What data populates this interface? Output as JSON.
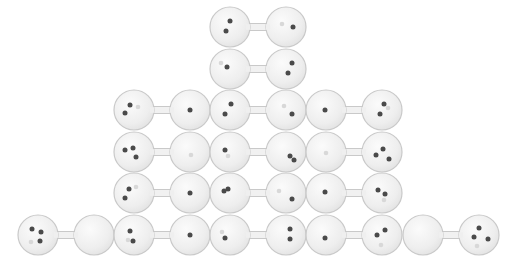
{
  "diagram": {
    "colors": {
      "background": "#ffffff",
      "bulb_fill": "#f1f1f1",
      "bulb_stroke": "#c9c9c9",
      "dot": "#4a4a4a",
      "ghost_dot": "#d8d8d8"
    },
    "columns": [
      {
        "label": "4-0",
        "dumbbells": [
          {
            "left": [
              [
                -6,
                -6
              ],
              [
                3,
                -3
              ],
              [
                2,
                6
              ]
            ],
            "left_ghost": [
              [
                -7,
                7
              ]
            ],
            "right": [],
            "right_ghost": []
          }
        ]
      },
      {
        "label": "3-1",
        "dumbbells": [
          {
            "left": [
              [
                -4,
                -5
              ],
              [
                -9,
                3
              ]
            ],
            "left_ghost": [
              [
                4,
                -3
              ]
            ],
            "right": [
              [
                0,
                0
              ]
            ],
            "right_ghost": []
          },
          {
            "left": [
              [
                -9,
                -2
              ],
              [
                -1,
                -4
              ],
              [
                2,
                5
              ]
            ],
            "left_ghost": [],
            "right": [],
            "right_ghost": [
              [
                1,
                3
              ]
            ]
          },
          {
            "left": [
              [
                -5,
                -4
              ],
              [
                -9,
                5
              ]
            ],
            "left_ghost": [
              [
                2,
                -6
              ]
            ],
            "right": [
              [
                0,
                0
              ]
            ],
            "right_ghost": []
          },
          {
            "left": [
              [
                -4,
                -4
              ],
              [
                -1,
                6
              ]
            ],
            "left_ghost": [
              [
                -6,
                5
              ]
            ],
            "right": [
              [
                0,
                0
              ]
            ],
            "right_ghost": []
          }
        ]
      },
      {
        "label": "2-2",
        "dumbbells": [
          {
            "left": [
              [
                0,
                -6
              ],
              [
                -4,
                4
              ]
            ],
            "left_ghost": [],
            "right": [
              [
                7,
                0
              ]
            ],
            "right_ghost": [
              [
                -4,
                -3
              ]
            ]
          },
          {
            "left": [
              [
                -3,
                -2
              ]
            ],
            "left_ghost": [
              [
                -9,
                -6
              ]
            ],
            "right": [
              [
                6,
                -6
              ],
              [
                2,
                4
              ]
            ],
            "right_ghost": []
          },
          {
            "left": [
              [
                1,
                -6
              ],
              [
                -5,
                4
              ]
            ],
            "left_ghost": [],
            "right": [
              [
                6,
                4
              ]
            ],
            "right_ghost": [
              [
                -2,
                -4
              ]
            ]
          },
          {
            "left": [
              [
                -5,
                -2
              ]
            ],
            "left_ghost": [
              [
                -2,
                4
              ]
            ],
            "right": [
              [
                4,
                4
              ],
              [
                8,
                8
              ]
            ],
            "right_ghost": []
          },
          {
            "left": [
              [
                -6,
                -2
              ],
              [
                -2,
                -4
              ]
            ],
            "left_ghost": [],
            "right": [
              [
                6,
                6
              ]
            ],
            "right_ghost": [
              [
                -7,
                -2
              ]
            ]
          },
          {
            "left": [
              [
                -5,
                3
              ]
            ],
            "left_ghost": [
              [
                -8,
                -3
              ]
            ],
            "right": [
              [
                4,
                -6
              ],
              [
                4,
                4
              ]
            ],
            "right_ghost": []
          }
        ]
      },
      {
        "label": "1-3",
        "dumbbells": [
          {
            "left": [
              [
                -1,
                0
              ]
            ],
            "left_ghost": [],
            "right": [
              [
                2,
                -6
              ],
              [
                -2,
                4
              ]
            ],
            "right_gst": [],
            "right_ghost": [
              [
                6,
                -2
              ]
            ]
          },
          {
            "left": [],
            "left_ghost": [
              [
                0,
                1
              ]
            ],
            "right": [
              [
                -6,
                3
              ],
              [
                1,
                -3
              ],
              [
                7,
                7
              ]
            ],
            "right_ghost": []
          },
          {
            "left": [
              [
                -1,
                -1
              ]
            ],
            "left_ghost": [],
            "right": [
              [
                -4,
                -3
              ],
              [
                3,
                1
              ]
            ],
            "right_ghost": [
              [
                2,
                7
              ]
            ]
          },
          {
            "left": [
              [
                -1,
                3
              ]
            ],
            "left_ghost": [],
            "right": [
              [
                -5,
                0
              ],
              [
                3,
                -5
              ]
            ],
            "right_ghost": [
              [
                -1,
                10
              ]
            ]
          }
        ]
      },
      {
        "label": "0-4",
        "dumbbells": [
          {
            "left": [],
            "left_ghost": [],
            "right": [
              [
                -5,
                2
              ],
              [
                0,
                -7
              ],
              [
                9,
                4
              ]
            ],
            "right_ghost": [
              [
                -2,
                11
              ]
            ]
          }
        ]
      }
    ]
  }
}
